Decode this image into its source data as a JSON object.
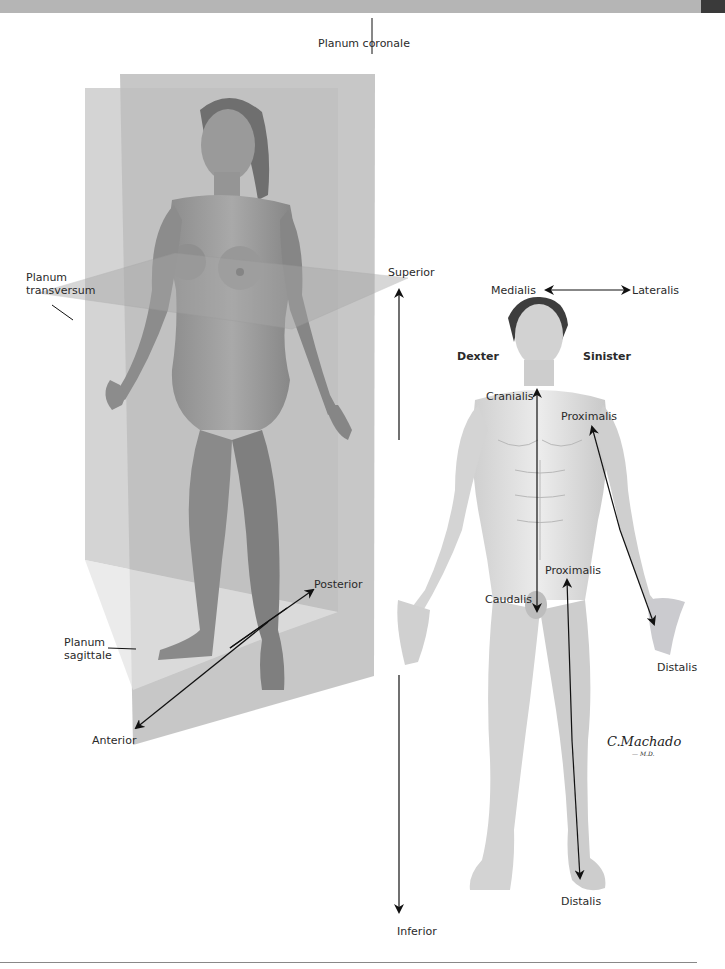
{
  "page": {
    "header_bar_color": "#b5b5b5",
    "header_tab_color": "#3a3a3a"
  },
  "left_figure": {
    "description": "Female figure with anatomical planes",
    "planes": {
      "coronal": "Planum coronale",
      "transverse_line1": "Planum",
      "transverse_line2": "transversum",
      "sagittal_line1": "Planum",
      "sagittal_line2": "sagittale"
    },
    "directions": {
      "anterior": "Anterior",
      "posterior": "Posterior"
    }
  },
  "center_axis": {
    "superior": "Superior",
    "inferior": "Inferior"
  },
  "right_figure": {
    "description": "Male figure with directional terms",
    "medialis": "Medialis",
    "lateralis": "Lateralis",
    "dexter": "Dexter",
    "sinister": "Sinister",
    "cranialis": "Cranialis",
    "caudalis": "Caudalis",
    "proximalis_arm": "Proximalis",
    "distalis_arm": "Distalis",
    "proximalis_leg": "Proximalis",
    "distalis_leg": "Distalis"
  },
  "signature": {
    "name": "C.Machado",
    "suffix": "— M.D."
  }
}
